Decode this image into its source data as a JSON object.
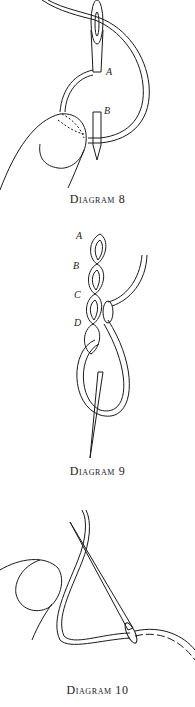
{
  "figures": [
    {
      "id": "diagram-8",
      "caption": "Diagram 8",
      "labels": [
        "A",
        "B"
      ]
    },
    {
      "id": "diagram-9",
      "caption": "Diagram 9",
      "labels": [
        "A",
        "B",
        "C",
        "D"
      ]
    },
    {
      "id": "diagram-10",
      "caption": "Diagram 10",
      "labels": []
    }
  ],
  "colors": {
    "line": "#1a1a1a",
    "background": "#ffffff"
  }
}
